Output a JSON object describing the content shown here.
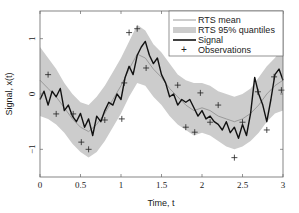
{
  "chart_data": {
    "type": "line",
    "title": "",
    "xlabel": "Time, t",
    "ylabel": "Signal, x(t)",
    "xlim": [
      0,
      3
    ],
    "ylim": [
      -1.5,
      1.5
    ],
    "xticks": [
      0,
      0.5,
      1,
      1.5,
      2,
      2.5,
      3
    ],
    "xtick_labels": [
      "0",
      "0.5",
      "1",
      "1.5",
      "2",
      "2.5",
      "3"
    ],
    "yticks": [
      1,
      0,
      -1
    ],
    "ytick_labels": [
      "1",
      "0",
      "−1"
    ],
    "grid": false,
    "legend_position": "upper right",
    "legend": [
      "RTS mean",
      "RTS 95% quantiles",
      "Signal",
      "Observations"
    ],
    "colors": {
      "mean": "#9a9a9a",
      "band": "#cccccc",
      "signal": "#111111",
      "observations": "#222222",
      "axes": "#555555"
    },
    "series": [
      {
        "name": "RTS mean",
        "x": [
          0,
          0.1,
          0.2,
          0.3,
          0.4,
          0.5,
          0.6,
          0.7,
          0.8,
          0.9,
          1.0,
          1.1,
          1.2,
          1.3,
          1.4,
          1.5,
          1.6,
          1.7,
          1.8,
          1.9,
          2.0,
          2.1,
          2.2,
          2.3,
          2.4,
          2.5,
          2.6,
          2.7,
          2.8,
          2.9,
          3.0
        ],
        "y": [
          0.25,
          0.1,
          -0.05,
          -0.25,
          -0.45,
          -0.6,
          -0.68,
          -0.55,
          -0.35,
          -0.1,
          0.15,
          0.45,
          0.72,
          0.65,
          0.45,
          0.3,
          0.1,
          -0.05,
          -0.2,
          -0.3,
          -0.25,
          -0.3,
          -0.4,
          -0.45,
          -0.5,
          -0.45,
          -0.35,
          -0.2,
          0.0,
          0.15,
          0.25
        ]
      },
      {
        "name": "RTS 95% quantiles",
        "x": [
          0,
          0.1,
          0.2,
          0.3,
          0.4,
          0.5,
          0.6,
          0.7,
          0.8,
          0.9,
          1.0,
          1.1,
          1.2,
          1.3,
          1.4,
          1.5,
          1.6,
          1.7,
          1.8,
          1.9,
          2.0,
          2.1,
          2.2,
          2.3,
          2.4,
          2.5,
          2.6,
          2.7,
          2.8,
          2.9,
          3.0
        ],
        "upper": [
          0.85,
          0.65,
          0.45,
          0.2,
          0.0,
          -0.15,
          -0.2,
          -0.05,
          0.15,
          0.4,
          0.65,
          0.95,
          1.25,
          1.15,
          0.9,
          0.75,
          0.55,
          0.35,
          0.25,
          0.2,
          0.2,
          0.15,
          0.05,
          0.0,
          -0.05,
          0.0,
          0.1,
          0.3,
          0.5,
          0.65,
          0.85
        ],
        "lower": [
          -0.4,
          -0.45,
          -0.55,
          -0.7,
          -0.9,
          -1.05,
          -1.15,
          -1.05,
          -0.85,
          -0.6,
          -0.35,
          -0.05,
          0.2,
          0.15,
          -0.05,
          -0.2,
          -0.4,
          -0.55,
          -0.65,
          -0.75,
          -0.7,
          -0.75,
          -0.85,
          -0.95,
          -1.0,
          -0.95,
          -0.85,
          -0.7,
          -0.5,
          -0.35,
          -0.3
        ]
      },
      {
        "name": "Signal",
        "x": [
          0,
          0.05,
          0.1,
          0.15,
          0.2,
          0.25,
          0.3,
          0.35,
          0.4,
          0.45,
          0.5,
          0.55,
          0.6,
          0.65,
          0.7,
          0.75,
          0.8,
          0.85,
          0.9,
          0.95,
          1.0,
          1.05,
          1.1,
          1.15,
          1.2,
          1.25,
          1.3,
          1.35,
          1.4,
          1.45,
          1.5,
          1.55,
          1.6,
          1.65,
          1.7,
          1.75,
          1.8,
          1.85,
          1.9,
          1.95,
          2.0,
          2.05,
          2.1,
          2.15,
          2.2,
          2.25,
          2.3,
          2.35,
          2.4,
          2.45,
          2.5,
          2.55,
          2.6,
          2.65,
          2.7,
          2.75,
          2.8,
          2.85,
          2.9,
          2.95,
          3.0
        ],
        "y": [
          -0.1,
          0.05,
          -0.2,
          0.05,
          -0.05,
          0.1,
          -0.3,
          -0.2,
          -0.4,
          -0.5,
          -0.35,
          -0.6,
          -0.45,
          -0.75,
          -0.4,
          -0.5,
          -0.3,
          -0.15,
          -0.2,
          0.0,
          -0.1,
          0.3,
          0.5,
          0.35,
          0.7,
          0.85,
          0.95,
          0.7,
          0.55,
          0.65,
          0.35,
          0.2,
          -0.05,
          0.0,
          -0.2,
          -0.1,
          -0.15,
          -0.1,
          -0.25,
          -0.4,
          -0.3,
          -0.45,
          -0.4,
          -0.5,
          -0.55,
          -0.65,
          -0.5,
          -0.7,
          -0.6,
          -0.8,
          -0.55,
          -0.75,
          -0.35,
          0.3,
          0.0,
          -0.2,
          -0.5,
          -0.1,
          0.35,
          0.45,
          0.25
        ]
      },
      {
        "name": "Observations",
        "x": [
          0.1,
          0.2,
          0.41,
          0.51,
          0.6,
          0.8,
          1.01,
          1.04,
          1.1,
          1.2,
          1.31,
          1.7,
          1.8,
          1.91,
          1.98,
          2.1,
          2.2,
          2.4,
          2.5,
          2.69,
          2.8,
          2.89,
          2.98
        ],
        "y": [
          0.35,
          -0.36,
          -0.36,
          -0.87,
          -1.0,
          -0.47,
          -0.45,
          0.2,
          1.11,
          1.18,
          0.47,
          0.16,
          -0.6,
          -0.69,
          0.02,
          -0.51,
          -0.2,
          -1.15,
          -0.51,
          0.04,
          -0.65,
          0.31,
          0.07
        ]
      }
    ]
  }
}
